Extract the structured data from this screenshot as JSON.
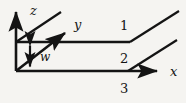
{
  "figure": {
    "type": "technical-line-diagram",
    "background_color": "#f5f4f1",
    "stroke_color": "#141414",
    "width": 186,
    "height": 103,
    "axes": {
      "z": {
        "label": "z",
        "label_x": 30,
        "label_y": 15,
        "from_x": 16,
        "from_y": 71,
        "to_x": 16,
        "to_y": 9
      },
      "y": {
        "label": "y",
        "label_x": 74,
        "label_y": 28,
        "from_x": 16,
        "from_y": 71,
        "to_x": 69,
        "to_y": 30
      },
      "x": {
        "label": "x",
        "label_x": 172,
        "label_y": 76,
        "from_x": 16,
        "from_y": 71,
        "to_x": 162,
        "to_y": 71
      }
    },
    "dimension": {
      "label": "w",
      "label_x": 40,
      "label_y": 58,
      "arrow_x": 30,
      "arrow_top_y": 42,
      "arrow_bottom_y": 70
    },
    "regions": [
      {
        "label": "1",
        "x": 120,
        "y": 30
      },
      {
        "label": "2",
        "x": 120,
        "y": 63
      },
      {
        "label": "3",
        "x": 120,
        "y": 93
      }
    ],
    "slab": {
      "top_line": {
        "x1": 16,
        "y1": 42,
        "x2": 130,
        "y2": 42
      },
      "top_diagonal": {
        "x1": 130,
        "y1": 42,
        "x2": 179,
        "y2": 11
      },
      "bottom_line": {
        "x1": 16,
        "y1": 71,
        "x2": 128,
        "y2": 71
      },
      "bottom_diagonal": {
        "x1": 128,
        "y1": 71,
        "x2": 177,
        "y2": 40
      },
      "left_upper_diagonal": {
        "x1": 16,
        "y1": 42,
        "x2": 61,
        "y2": 12
      }
    }
  }
}
